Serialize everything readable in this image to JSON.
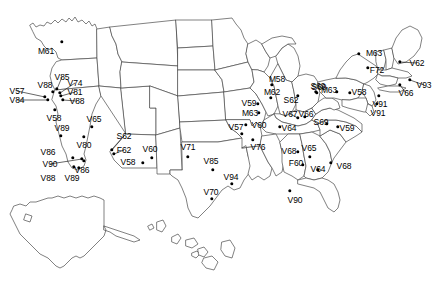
{
  "figure": {
    "name": "us-sites-map",
    "background_color": "#ffffff",
    "outline_color": "#4a4a4a",
    "marker_color": "#000000",
    "label_color": "#000000",
    "width": 437,
    "height": 299
  },
  "markers": [
    {
      "id": "m61",
      "label": "M61",
      "mx": 62,
      "my": 42,
      "lx": 46,
      "ly": 51,
      "leader": false
    },
    {
      "id": "v57",
      "label": "V57",
      "mx": 45,
      "my": 97,
      "lx": 17,
      "ly": 91,
      "leader": true
    },
    {
      "id": "v88a",
      "label": "V88",
      "mx": 53,
      "my": 92,
      "lx": 45,
      "ly": 85,
      "leader": false
    },
    {
      "id": "v85",
      "label": "V85",
      "mx": 57,
      "my": 89,
      "lx": 62,
      "ly": 77,
      "leader": true
    },
    {
      "id": "v74",
      "label": "V74",
      "mx": 60,
      "my": 93,
      "lx": 75,
      "ly": 83,
      "leader": true
    },
    {
      "id": "v81",
      "label": "V81",
      "mx": 61,
      "my": 96,
      "lx": 75,
      "ly": 92,
      "leader": true
    },
    {
      "id": "v88b",
      "label": "V88",
      "mx": 63,
      "my": 100,
      "lx": 77,
      "ly": 101,
      "leader": true
    },
    {
      "id": "v84",
      "label": "V84",
      "mx": 48,
      "my": 100,
      "lx": 17,
      "ly": 100,
      "leader": true
    },
    {
      "id": "v58a",
      "label": "V58",
      "mx": 55,
      "my": 110,
      "lx": 54,
      "ly": 118,
      "leader": false
    },
    {
      "id": "v89a",
      "label": "V89",
      "mx": 61,
      "my": 136,
      "lx": 62,
      "ly": 128,
      "leader": false
    },
    {
      "id": "v65",
      "label": "V65",
      "mx": 92,
      "my": 127,
      "lx": 94,
      "ly": 119,
      "leader": false
    },
    {
      "id": "v80",
      "label": "V80",
      "mx": 84,
      "my": 137,
      "lx": 84,
      "ly": 145,
      "leader": false
    },
    {
      "id": "v86a",
      "label": "V86",
      "mx": 73,
      "my": 158,
      "lx": 48,
      "ly": 152,
      "leader": false
    },
    {
      "id": "v90a",
      "label": "V90",
      "mx": 82,
      "my": 159,
      "lx": 50,
      "ly": 164,
      "leader": true
    },
    {
      "id": "v86b",
      "label": "V86",
      "mx": 84,
      "my": 161,
      "lx": 82,
      "ly": 170,
      "leader": false
    },
    {
      "id": "v88c",
      "label": "V88",
      "mx": 74,
      "my": 167,
      "lx": 48,
      "ly": 178,
      "leader": false
    },
    {
      "id": "v89b",
      "label": "V89",
      "mx": 79,
      "my": 168,
      "lx": 72,
      "ly": 178,
      "leader": false
    },
    {
      "id": "s62a",
      "label": "S62",
      "mx": 112,
      "my": 150,
      "lx": 124,
      "ly": 136,
      "leader": true
    },
    {
      "id": "f62",
      "label": "F62",
      "mx": 114,
      "my": 154,
      "lx": 124,
      "ly": 150,
      "leader": true
    },
    {
      "id": "v58b",
      "label": "V58",
      "mx": 143,
      "my": 163,
      "lx": 128,
      "ly": 162,
      "leader": false
    },
    {
      "id": "v60a",
      "label": "V60",
      "mx": 152,
      "my": 158,
      "lx": 150,
      "ly": 149,
      "leader": false
    },
    {
      "id": "v71",
      "label": "V71",
      "mx": 188,
      "my": 157,
      "lx": 188,
      "ly": 147,
      "leader": false
    },
    {
      "id": "v85b",
      "label": "V85",
      "mx": 213,
      "my": 170,
      "lx": 211,
      "ly": 161,
      "leader": false
    },
    {
      "id": "v57b",
      "label": "V57",
      "mx": 242,
      "my": 134,
      "lx": 236,
      "ly": 127,
      "leader": false
    },
    {
      "id": "v60b",
      "label": "V60",
      "mx": 246,
      "my": 125,
      "lx": 259,
      "ly": 125,
      "leader": false
    },
    {
      "id": "v76",
      "label": "V76",
      "mx": 253,
      "my": 140,
      "lx": 258,
      "ly": 147,
      "leader": false
    },
    {
      "id": "v94",
      "label": "V94",
      "mx": 232,
      "my": 184,
      "lx": 231,
      "ly": 177,
      "leader": false
    },
    {
      "id": "v70",
      "label": "V70",
      "mx": 212,
      "my": 199,
      "lx": 211,
      "ly": 192,
      "leader": false
    },
    {
      "id": "v90b",
      "label": "V90",
      "mx": 290,
      "my": 191,
      "lx": 295,
      "ly": 200,
      "leader": false
    },
    {
      "id": "v59a",
      "label": "V59",
      "mx": 258,
      "my": 104,
      "lx": 249,
      "ly": 103,
      "leader": false
    },
    {
      "id": "m63a",
      "label": "M63",
      "mx": 259,
      "my": 113,
      "lx": 250,
      "ly": 113,
      "leader": false
    },
    {
      "id": "m58",
      "label": "M58",
      "mx": 272,
      "my": 85,
      "lx": 277,
      "ly": 79,
      "leader": false
    },
    {
      "id": "m62",
      "label": "M62",
      "mx": 271,
      "my": 98,
      "lx": 272,
      "ly": 92,
      "leader": false
    },
    {
      "id": "s62b",
      "label": "S62",
      "mx": 298,
      "my": 96,
      "lx": 291,
      "ly": 100,
      "leader": false
    },
    {
      "id": "s69a",
      "label": "S69",
      "mx": 317,
      "my": 93,
      "lx": 319,
      "ly": 87,
      "leader": false
    },
    {
      "id": "v67",
      "label": "V67",
      "mx": 298,
      "my": 118,
      "lx": 290,
      "ly": 114,
      "leader": true
    },
    {
      "id": "v66a",
      "label": "V66",
      "mx": 305,
      "my": 117,
      "lx": 306,
      "ly": 114,
      "leader": false
    },
    {
      "id": "v64a",
      "label": "V64",
      "mx": 280,
      "my": 127,
      "lx": 289,
      "ly": 128,
      "leader": false
    },
    {
      "id": "s69b",
      "label": "S69",
      "mx": 327,
      "my": 124,
      "lx": 321,
      "ly": 122,
      "leader": false
    },
    {
      "id": "m63b",
      "label": "M63",
      "mx": 337,
      "my": 92,
      "lx": 329,
      "ly": 90,
      "leader": false
    },
    {
      "id": "v58c",
      "label": "V58",
      "mx": 350,
      "my": 93,
      "lx": 359,
      "ly": 92,
      "leader": false
    },
    {
      "id": "s69c",
      "label": "S69",
      "mx": 316,
      "my": 92,
      "lx": 318,
      "ly": 86,
      "leader": false
    },
    {
      "id": "v59b",
      "label": "V59",
      "mx": 338,
      "my": 127,
      "lx": 347,
      "ly": 128,
      "leader": false
    },
    {
      "id": "m63c",
      "label": "M63",
      "mx": 359,
      "my": 54,
      "lx": 374,
      "ly": 53,
      "leader": false
    },
    {
      "id": "f72",
      "label": "F72",
      "mx": 368,
      "my": 68,
      "lx": 377,
      "ly": 70,
      "leader": false
    },
    {
      "id": "v62",
      "label": "V62",
      "mx": 400,
      "my": 62,
      "lx": 417,
      "ly": 63,
      "leader": true
    },
    {
      "id": "v93",
      "label": "V93",
      "mx": 410,
      "my": 80,
      "lx": 424,
      "ly": 85,
      "leader": true
    },
    {
      "id": "v66b",
      "label": "V66",
      "mx": 400,
      "my": 85,
      "lx": 406,
      "ly": 93,
      "leader": true
    },
    {
      "id": "v91a",
      "label": "V91",
      "mx": 379,
      "my": 96,
      "lx": 380,
      "ly": 104,
      "leader": false
    },
    {
      "id": "v91b",
      "label": "V91",
      "mx": 377,
      "my": 104,
      "lx": 378,
      "ly": 113,
      "leader": false
    },
    {
      "id": "v68a",
      "label": "V68",
      "mx": 298,
      "my": 152,
      "lx": 289,
      "ly": 151,
      "leader": false
    },
    {
      "id": "v65b",
      "label": "V65",
      "mx": 310,
      "my": 157,
      "lx": 309,
      "ly": 148,
      "leader": false
    },
    {
      "id": "f60",
      "label": "F60",
      "mx": 303,
      "my": 165,
      "lx": 296,
      "ly": 163,
      "leader": false
    },
    {
      "id": "v64b",
      "label": "V64",
      "mx": 318,
      "my": 170,
      "lx": 318,
      "ly": 169,
      "leader": false
    },
    {
      "id": "v68b",
      "label": "V68",
      "mx": 331,
      "my": 163,
      "lx": 344,
      "ly": 166,
      "leader": false
    }
  ]
}
